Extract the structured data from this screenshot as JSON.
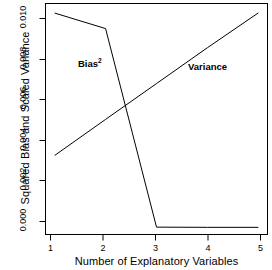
{
  "chart_data": {
    "type": "line",
    "title": "",
    "xlabel": "Number of Explanatory Variables",
    "ylabel": "Squared Bias and Scaled Variance",
    "xlim": [
      0.82,
      5.18
    ],
    "ylim": [
      -0.00035,
      0.01125
    ],
    "grid": false,
    "legend": "in-plot annotations",
    "x": [
      1,
      2,
      3,
      4,
      5
    ],
    "xticks": [
      "1",
      "2",
      "3",
      "4",
      "5"
    ],
    "yticks": [
      "0.000",
      "0.002",
      "0.004",
      "0.006",
      "0.008",
      "0.010"
    ],
    "ytick_values": [
      0.0,
      0.002,
      0.004,
      0.006,
      0.008,
      0.01
    ],
    "series": [
      {
        "name": "Bias²",
        "label_text": "Bias",
        "label_sup": "2",
        "values": [
          0.01077,
          0.00999,
          2e-05,
          1e-05,
          1e-05
        ],
        "color": "#000000"
      },
      {
        "name": "Variance",
        "label_text": "Variance",
        "label_sup": "",
        "values": [
          0.00362,
          0.00543,
          0.00723,
          0.00903,
          0.01078
        ],
        "color": "#000000"
      }
    ],
    "annotations": [
      {
        "text": "Bias",
        "sup": "2",
        "x": 2.0,
        "y": 0.0078
      },
      {
        "text": "Variance",
        "sup": "",
        "x": 3.5,
        "y": 0.0077
      }
    ],
    "crossing_point": {
      "x": 2.4,
      "y": 0.0061
    }
  },
  "axis": {
    "y_title": "Squared Bias and Scaled Variance",
    "x_title": "Number of Explanatory Variables",
    "y_tick_0": "0.000",
    "y_tick_1": "0.002",
    "y_tick_2": "0.004",
    "y_tick_3": "0.006",
    "y_tick_4": "0.008",
    "y_tick_5": "0.010",
    "x_tick_0": "1",
    "x_tick_1": "2",
    "x_tick_2": "3",
    "x_tick_3": "4",
    "x_tick_4": "5"
  },
  "labels": {
    "bias_text": "Bias",
    "bias_sup": "2",
    "variance_text": "Variance"
  },
  "colors": {
    "line": "#000000",
    "axis": "#000000",
    "background": "#ffffff"
  }
}
